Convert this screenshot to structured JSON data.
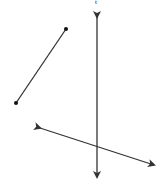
{
  "diagram": {
    "stroke_color": "#333333",
    "background": "#ffffff",
    "label_top": "t",
    "segment": {
      "p1": [
        66,
        29
      ],
      "p2": [
        16,
        103
      ],
      "endpoints": "dots"
    },
    "vertical_line": {
      "p1": [
        97,
        16
      ],
      "p2": [
        97,
        178
      ],
      "arrows": "both"
    },
    "slanted_line": {
      "p1": [
        39,
        128
      ],
      "p2": [
        155,
        165
      ],
      "arrows": "both"
    }
  }
}
